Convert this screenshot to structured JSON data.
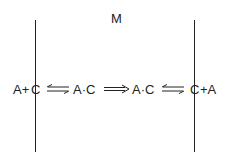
{
  "diagram": {
    "membrane_label": "M",
    "species": {
      "left_outside": "A+",
      "left_carrier": "C",
      "complex_1": "A·C",
      "complex_2": "A·C",
      "right_carrier": "C",
      "right_outside": "+A"
    },
    "arrows": [
      {
        "type": "reversible",
        "from": "A+C",
        "to": "A·C"
      },
      {
        "type": "forward-double",
        "from": "A·C",
        "to": "A·C"
      },
      {
        "type": "reversible",
        "from": "A·C",
        "to": "C+A"
      }
    ],
    "colors": {
      "ink": "#222222",
      "background": "#ffffff"
    }
  }
}
